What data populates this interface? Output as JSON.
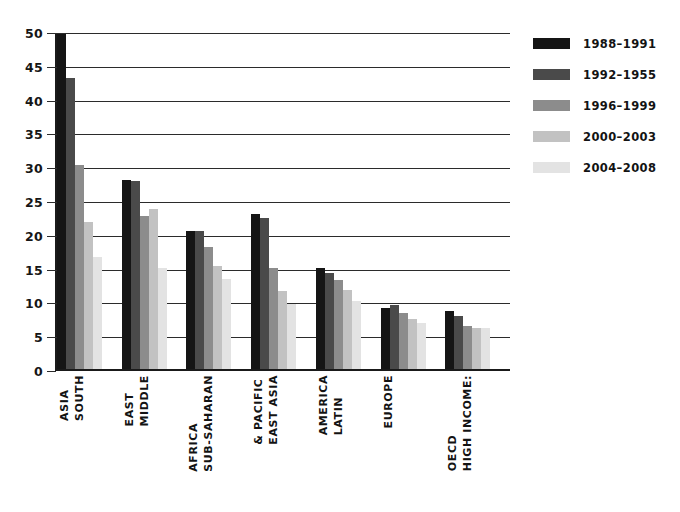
{
  "chart_data": {
    "type": "bar",
    "title": "",
    "subtitle": "",
    "xlabel": "",
    "ylabel": "",
    "ylim": [
      0,
      50
    ],
    "ytick_step": 5,
    "yticks": [
      "0",
      "5",
      "10",
      "15",
      "20",
      "25",
      "30",
      "35",
      "40",
      "45",
      "50"
    ],
    "grid": true,
    "legend_position": "right",
    "categories": [
      "SOUTH ASIA",
      "MIDDLE EAST",
      "SUB-SAHARAN AFRICA",
      "EAST ASIA & PACIFIC",
      "LATIN AMERICA",
      "EUROPE",
      "HIGH INCOME: OECD"
    ],
    "category_lines": [
      [
        "SOUTH",
        "ASIA"
      ],
      [
        "MIDDLE",
        "EAST"
      ],
      [
        "SUB-SAHARAN",
        "AFRICA"
      ],
      [
        "EAST ASIA",
        "& PACIFIC"
      ],
      [
        "LATIN",
        "AMERICA"
      ],
      [
        "EUROPE"
      ],
      [
        "HIGH INCOME:",
        "OECD"
      ]
    ],
    "series": [
      {
        "name": "1988–1991",
        "color": "#151515",
        "values": [
          49.6,
          28.0,
          20.4,
          23.0,
          15.0,
          9.0,
          8.6
        ]
      },
      {
        "name": "1992–1955",
        "color": "#4a4a4a",
        "values": [
          43.0,
          27.8,
          20.4,
          22.3,
          14.2,
          9.4,
          7.8
        ]
      },
      {
        "name": "1996–1999",
        "color": "#8c8c8c",
        "values": [
          30.2,
          22.7,
          18.0,
          14.9,
          13.2,
          8.3,
          6.3
        ]
      },
      {
        "name": "2000–2003",
        "color": "#c2c2c2",
        "values": [
          21.7,
          23.7,
          15.3,
          11.6,
          11.7,
          7.4,
          6.1
        ]
      },
      {
        "name": "2004–2008",
        "color": "#e3e3e3",
        "values": [
          16.5,
          15.0,
          13.3,
          9.6,
          10.0,
          6.8,
          6.0
        ]
      }
    ]
  },
  "axis": {
    "line_color": "#1a1a1a",
    "grid_color": "#2b2b2b"
  },
  "legend": {
    "items": [
      {
        "label": "1988–1991",
        "color": "#151515"
      },
      {
        "label": "1992–1955",
        "color": "#4a4a4a"
      },
      {
        "label": "1996–1999",
        "color": "#8c8c8c"
      },
      {
        "label": "2000–2003",
        "color": "#c2c2c2"
      },
      {
        "label": "2004–2008",
        "color": "#e3e3e3"
      }
    ]
  }
}
